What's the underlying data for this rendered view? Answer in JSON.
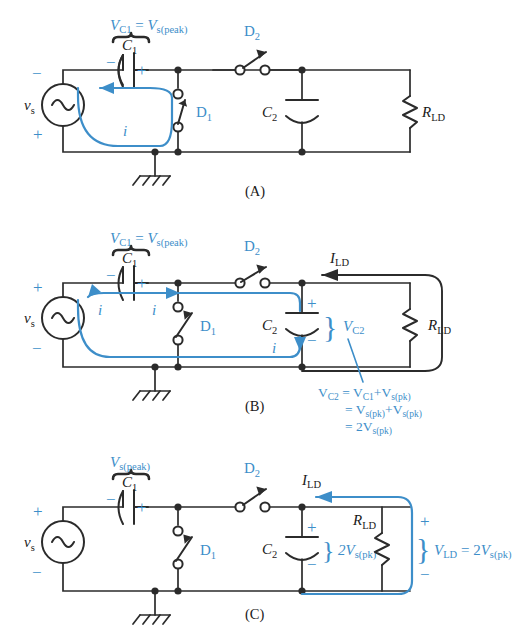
{
  "figure": {
    "type": "circuit-diagram",
    "accent_color": "#3d8ec9",
    "line_color": "#2b2b2b"
  },
  "panels": [
    {
      "id": "A",
      "caption": "(A)",
      "source": {
        "label": "v",
        "sub": "s",
        "top_sign": "−",
        "bottom_sign": "+"
      },
      "c1": {
        "label": "C",
        "sub": "1",
        "left_sign": "−",
        "right_sign": "+"
      },
      "c1_brace_label": {
        "text": "V",
        "sub1": "C1",
        "mid": " = ",
        "text2": "V",
        "sub2": "s(peak)"
      },
      "d1": {
        "label": "D",
        "sub": "1",
        "state": "closed"
      },
      "d2": {
        "label": "D",
        "sub": "2",
        "state": "open"
      },
      "c2": {
        "label": "C",
        "sub": "2"
      },
      "rld": {
        "label": "R",
        "sub": "LD"
      },
      "current": {
        "label": "i",
        "color": "#3d8ec9"
      }
    },
    {
      "id": "B",
      "caption": "(B)",
      "source": {
        "label": "v",
        "sub": "s",
        "top_sign": "+",
        "bottom_sign": "−"
      },
      "c1": {
        "label": "C",
        "sub": "1",
        "left_sign": "−",
        "right_sign": "+"
      },
      "c1_brace_label": {
        "text": "V",
        "sub1": "C1",
        "mid": " = ",
        "text2": "V",
        "sub2": "s(peak)"
      },
      "d1": {
        "label": "D",
        "sub": "1",
        "state": "open"
      },
      "d2": {
        "label": "D",
        "sub": "2",
        "state": "closed"
      },
      "c2": {
        "label": "C",
        "sub": "2",
        "top_sign": "+",
        "bottom_sign": "−"
      },
      "vc2": {
        "text": "V",
        "sub": "C2"
      },
      "rld": {
        "label": "R",
        "sub": "LD"
      },
      "ild": {
        "text": "I",
        "sub": "LD"
      },
      "current": {
        "label": "i",
        "color": "#3d8ec9"
      },
      "equation": [
        {
          "lhs": "V",
          "lhs_sub": "C2",
          "op": " = ",
          "r1": "V",
          "r1_sub": "C1",
          "plus": "+",
          "r2": "V",
          "r2_sub": "s(pk)"
        },
        {
          "lhs": "",
          "lhs_sub": "",
          "op": " = ",
          "r1": "V",
          "r1_sub": "s(pk)",
          "plus": "+",
          "r2": "V",
          "r2_sub": "s(pk)"
        },
        {
          "lhs": "",
          "lhs_sub": "",
          "op": " = ",
          "r1": "2V",
          "r1_sub": "s(pk)",
          "plus": "",
          "r2": "",
          "r2_sub": ""
        }
      ]
    },
    {
      "id": "C",
      "caption": "(C)",
      "source": {
        "label": "v",
        "sub": "s",
        "top_sign": "+",
        "bottom_sign": "−"
      },
      "c1": {
        "label": "C",
        "sub": "1",
        "left_sign": "−",
        "right_sign": "+"
      },
      "c1_brace_label": {
        "text": "V",
        "sub1": "s(peak)"
      },
      "d1": {
        "label": "D",
        "sub": "1",
        "state": "open"
      },
      "d2": {
        "label": "D",
        "sub": "2",
        "state": "open"
      },
      "c2": {
        "label": "C",
        "sub": "2",
        "top_sign": "+",
        "bottom_sign": "−"
      },
      "c2_brace_label": {
        "text": "2V",
        "sub": "s(pk)"
      },
      "rld": {
        "label": "R",
        "sub": "LD"
      },
      "ild": {
        "text": "I",
        "sub": "LD"
      },
      "vld": {
        "text": "V",
        "sub": "LD",
        "op": " = ",
        "value": "2V",
        "value_sub": "s(pk)",
        "top_sign": "+",
        "bottom_sign": "−"
      }
    }
  ]
}
